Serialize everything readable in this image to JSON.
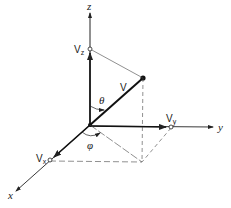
{
  "diagram": {
    "type": "3d-vector-components",
    "axes": {
      "x": {
        "label": "x"
      },
      "y": {
        "label": "y"
      },
      "z": {
        "label": "z"
      }
    },
    "vector": {
      "label": "V"
    },
    "components": {
      "vx": {
        "label": "Vx",
        "main": "V",
        "sub": "x"
      },
      "vy": {
        "label": "Vy",
        "main": "V",
        "sub": "y"
      },
      "vz": {
        "label": "Vz",
        "main": "V",
        "sub": "z"
      }
    },
    "angles": {
      "theta": {
        "label": "θ"
      },
      "phi": {
        "label": "φ"
      }
    },
    "colors": {
      "line": "#222222",
      "dashed": "#555555",
      "background": "#ffffff"
    }
  }
}
